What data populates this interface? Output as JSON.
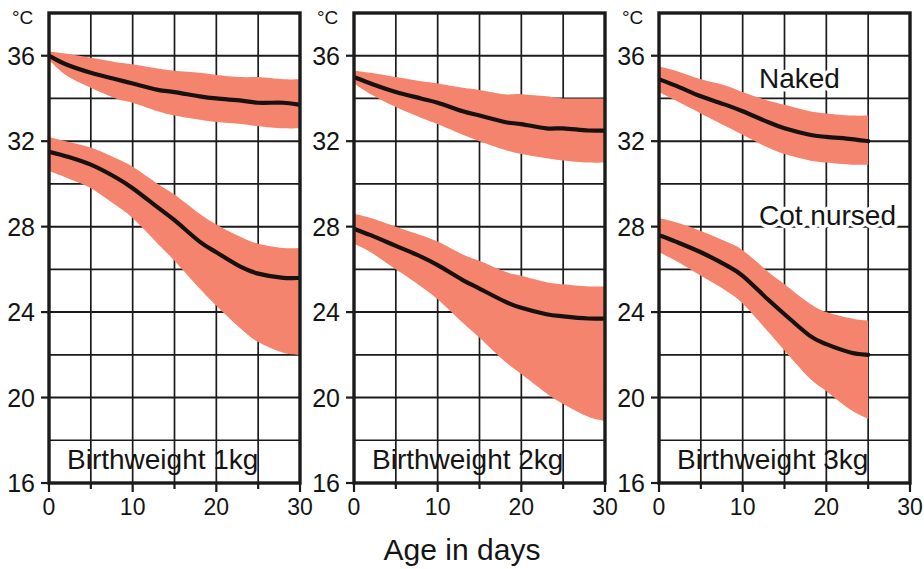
{
  "chart_data": {
    "type": "area",
    "title": "",
    "xlabel": "Age in days",
    "ylabel": "°C",
    "unit_label": "°C",
    "xlim": [
      0,
      30
    ],
    "ylim": [
      16,
      38
    ],
    "xticks": [
      0,
      10,
      20,
      30
    ],
    "xticklabels": [
      "0",
      "10",
      "20",
      "30"
    ],
    "yticks": [
      16,
      20,
      24,
      28,
      32,
      36
    ],
    "yticklabels": [
      "16",
      "20",
      "24",
      "28",
      "32",
      "36"
    ],
    "grid": true,
    "grid_x_step": 5,
    "grid_y_step": 2,
    "legend_position": "inside-panel-3",
    "band_color": "#f4846e",
    "line_color": "#17120f",
    "series_labels": [
      "Naked",
      "Cot nursed"
    ],
    "panels": [
      {
        "name": "Birthweight 1kg",
        "label": "Birthweight 1kg",
        "series": [
          {
            "name": "Naked",
            "x": [
              0,
              2,
              5,
              8,
              10,
              13,
              15,
              18,
              20,
              23,
              25,
              28,
              30
            ],
            "mean": [
              36.0,
              35.6,
              35.2,
              34.9,
              34.7,
              34.4,
              34.3,
              34.1,
              34.0,
              33.9,
              33.8,
              33.8,
              33.7
            ],
            "upper": [
              36.2,
              36.1,
              35.9,
              35.7,
              35.6,
              35.4,
              35.3,
              35.2,
              35.1,
              35.0,
              35.0,
              34.9,
              34.9
            ],
            "lower": [
              35.8,
              35.1,
              34.5,
              34.0,
              33.8,
              33.4,
              33.2,
              33.0,
              32.9,
              32.8,
              32.7,
              32.6,
              32.6
            ]
          },
          {
            "name": "Cot nursed",
            "x": [
              0,
              2,
              5,
              8,
              10,
              13,
              15,
              18,
              20,
              23,
              25,
              28,
              30
            ],
            "mean": [
              31.5,
              31.3,
              30.9,
              30.3,
              29.8,
              28.9,
              28.3,
              27.3,
              26.8,
              26.1,
              25.8,
              25.6,
              25.6
            ],
            "upper": [
              32.2,
              32.0,
              31.7,
              31.2,
              30.8,
              30.0,
              29.5,
              28.6,
              28.1,
              27.5,
              27.2,
              27.0,
              27.0
            ],
            "lower": [
              30.6,
              30.3,
              29.8,
              29.0,
              28.4,
              27.2,
              26.4,
              25.1,
              24.3,
              23.2,
              22.6,
              22.1,
              22.0
            ]
          }
        ]
      },
      {
        "name": "Birthweight 2kg",
        "label": "Birthweight 2kg",
        "series": [
          {
            "name": "Naked",
            "x": [
              0,
              2,
              5,
              8,
              10,
              13,
              15,
              18,
              20,
              23,
              25,
              28,
              30
            ],
            "mean": [
              35.0,
              34.7,
              34.3,
              34.0,
              33.8,
              33.4,
              33.2,
              32.9,
              32.8,
              32.6,
              32.6,
              32.5,
              32.5
            ],
            "upper": [
              35.3,
              35.2,
              35.0,
              34.8,
              34.7,
              34.5,
              34.4,
              34.2,
              34.2,
              34.1,
              34.0,
              34.0,
              34.0
            ],
            "lower": [
              34.7,
              34.2,
              33.6,
              33.1,
              32.8,
              32.3,
              32.0,
              31.6,
              31.4,
              31.2,
              31.1,
              31.0,
              31.0
            ]
          },
          {
            "name": "Cot nursed",
            "x": [
              0,
              2,
              5,
              8,
              10,
              13,
              15,
              18,
              20,
              23,
              25,
              28,
              30
            ],
            "mean": [
              27.9,
              27.6,
              27.1,
              26.6,
              26.2,
              25.5,
              25.1,
              24.5,
              24.2,
              23.9,
              23.8,
              23.7,
              23.7
            ],
            "upper": [
              28.6,
              28.4,
              28.0,
              27.6,
              27.3,
              26.7,
              26.4,
              25.9,
              25.7,
              25.4,
              25.3,
              25.2,
              25.2
            ],
            "lower": [
              27.2,
              26.8,
              26.0,
              25.2,
              24.6,
              23.5,
              22.8,
              21.7,
              21.1,
              20.2,
              19.7,
              19.1,
              18.9
            ]
          }
        ]
      },
      {
        "name": "Birthweight 3kg",
        "label": "Birthweight 3kg",
        "series": [
          {
            "name": "Naked",
            "x": [
              0,
              2,
              5,
              8,
              10,
              13,
              15,
              18,
              20,
              23,
              25
            ],
            "mean": [
              34.9,
              34.6,
              34.1,
              33.7,
              33.4,
              32.9,
              32.6,
              32.3,
              32.2,
              32.1,
              32.0
            ],
            "upper": [
              35.5,
              35.3,
              34.9,
              34.6,
              34.3,
              33.9,
              33.7,
              33.4,
              33.3,
              33.2,
              33.2
            ],
            "lower": [
              34.3,
              33.9,
              33.3,
              32.7,
              32.3,
              31.7,
              31.4,
              31.1,
              31.0,
              30.9,
              30.9
            ]
          },
          {
            "name": "Cot nursed",
            "x": [
              0,
              2,
              5,
              8,
              10,
              13,
              15,
              18,
              20,
              23,
              25
            ],
            "mean": [
              27.6,
              27.3,
              26.8,
              26.2,
              25.7,
              24.6,
              23.9,
              22.9,
              22.5,
              22.1,
              22.0
            ],
            "upper": [
              28.4,
              28.2,
              27.8,
              27.3,
              26.9,
              25.9,
              25.3,
              24.4,
              24.0,
              23.7,
              23.6
            ],
            "lower": [
              26.8,
              26.4,
              25.7,
              25.0,
              24.4,
              23.1,
              22.2,
              20.9,
              20.3,
              19.4,
              19.0
            ]
          }
        ]
      }
    ]
  },
  "figure": {
    "axis_title": "Age in days",
    "unit": "°C",
    "panel_labels": [
      "Birthweight 1kg",
      "Birthweight 2kg",
      "Birthweight 3kg"
    ],
    "annotations": [
      "Naked",
      "Cot nursed"
    ],
    "ytick_labels": [
      "36",
      "32",
      "28",
      "24",
      "20",
      "16"
    ],
    "xtick_labels": [
      "0",
      "10",
      "20",
      "30"
    ]
  }
}
